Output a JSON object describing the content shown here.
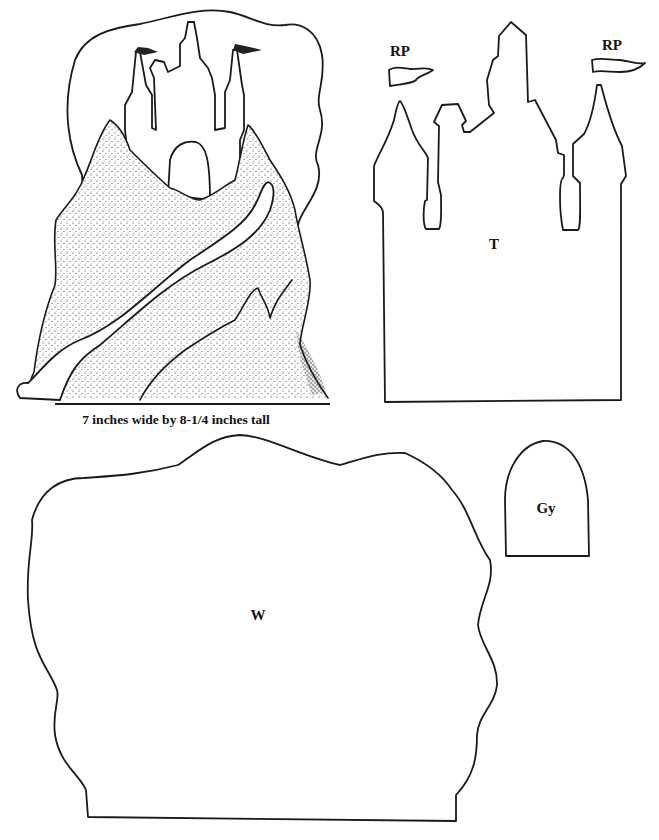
{
  "sheet": {
    "caption": "7 inches wide by 8-1/4 inches tall",
    "colors": {
      "ink": "#1a1a1a",
      "paper": "#ffffff"
    }
  },
  "illustration": {
    "subject": "castle on stippled hill with winding path",
    "flags_count": 2
  },
  "pieces": [
    {
      "id": "rp-left",
      "label": "RP",
      "shape": "left pennant flag"
    },
    {
      "id": "rp-right",
      "label": "RP",
      "shape": "right pennant flag"
    },
    {
      "id": "t",
      "label": "T",
      "shape": "castle towers silhouette"
    },
    {
      "id": "w",
      "label": "W",
      "shape": "wavy backdrop / wall"
    },
    {
      "id": "gy",
      "label": "Gy",
      "shape": "arched doorway"
    }
  ]
}
